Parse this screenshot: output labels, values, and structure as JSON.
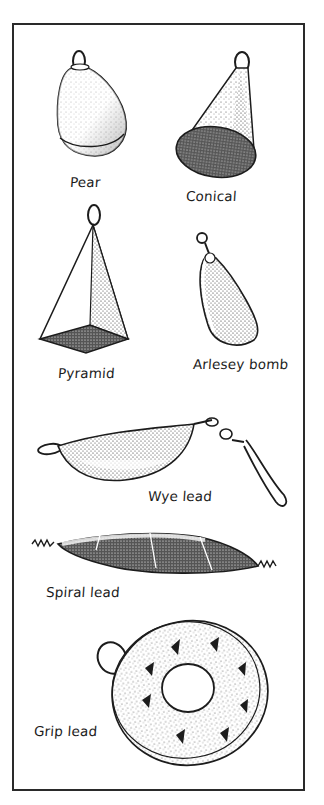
{
  "figure": {
    "colors": {
      "ink": "#1c1c1c",
      "border": "#2a2a2a",
      "paper": "#ffffff"
    },
    "items": [
      {
        "id": "pear",
        "label": "Pear"
      },
      {
        "id": "conical",
        "label": "Conical"
      },
      {
        "id": "pyramid",
        "label": "Pyramid"
      },
      {
        "id": "arlesey-bomb",
        "label": "Arlesey bomb"
      },
      {
        "id": "wye-lead",
        "label": "Wye lead"
      },
      {
        "id": "spiral-lead",
        "label": "Spiral lead"
      },
      {
        "id": "grip-lead",
        "label": "Grip lead"
      }
    ]
  }
}
